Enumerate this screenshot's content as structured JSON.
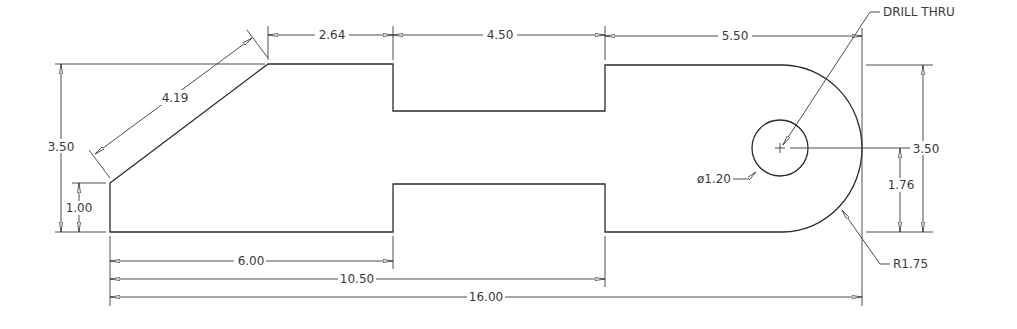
{
  "drawing": {
    "type": "2D mechanical part drawing",
    "units": "inches",
    "dimensions": {
      "top_chamfer_to_notch": "2.64",
      "top_notch_width": "4.50",
      "top_notch_to_end": "5.50",
      "chamfer_length": "4.19",
      "overall_height_left": "3.50",
      "chamfer_height": "1.00",
      "bottom_to_notch": "6.00",
      "bottom_to_notch_end": "10.50",
      "overall_length": "16.00",
      "hole_diameter": "ø1.20",
      "hole_height": "1.76",
      "overall_height_right": "3.50",
      "end_radius": "R1.75"
    },
    "notes": {
      "hole_callout": "DRILL THRU"
    }
  }
}
